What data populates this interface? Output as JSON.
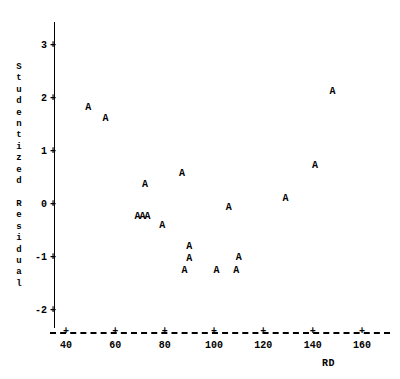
{
  "chart": {
    "type": "scatter",
    "title": "",
    "marker_symbol": "A",
    "y_axis_title": "Studentized\nResidual",
    "y_axis_title_vertical": "S\nt\nu\nd\ne\nn\nt\ni\nz\ne\nd\n \nR\ne\ns\ni\nd\nu\na\nl",
    "x_axis_title": "RD",
    "x_ticks": [
      "40",
      "60",
      "80",
      "100",
      "120",
      "140",
      "160"
    ],
    "y_ticks": [
      "3",
      "2",
      "1",
      "0",
      "-1",
      "-2"
    ],
    "tick_glyph": "+"
  },
  "chart_data": {
    "type": "scatter",
    "title": "",
    "xlabel": "RD",
    "ylabel": "Studentized Residual",
    "xlim": [
      34,
      172
    ],
    "ylim": [
      -2.4,
      3.5
    ],
    "xticks": [
      40,
      60,
      80,
      100,
      120,
      140,
      160
    ],
    "yticks": [
      3,
      2,
      1,
      0,
      -1,
      -2
    ],
    "grid": false,
    "legend": null,
    "marker": "A",
    "series": [
      {
        "name": "A",
        "points": [
          {
            "x": 49,
            "y": 1.83
          },
          {
            "x": 56,
            "y": 1.62
          },
          {
            "x": 72,
            "y": 0.38
          },
          {
            "x": 69,
            "y": -0.23
          },
          {
            "x": 71,
            "y": -0.23
          },
          {
            "x": 73,
            "y": -0.23
          },
          {
            "x": 79,
            "y": -0.4
          },
          {
            "x": 87,
            "y": 0.58
          },
          {
            "x": 88,
            "y": -1.25
          },
          {
            "x": 90,
            "y": -0.79
          },
          {
            "x": 90,
            "y": -1.02
          },
          {
            "x": 101,
            "y": -1.25
          },
          {
            "x": 106,
            "y": -0.06
          },
          {
            "x": 109,
            "y": -1.25
          },
          {
            "x": 110,
            "y": -1.0
          },
          {
            "x": 129,
            "y": 0.11
          },
          {
            "x": 141,
            "y": 0.74
          },
          {
            "x": 148,
            "y": 2.13
          }
        ]
      }
    ]
  }
}
